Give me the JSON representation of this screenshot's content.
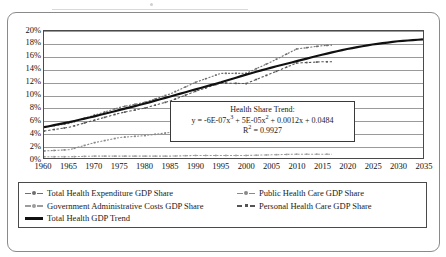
{
  "chart_data": {
    "type": "line",
    "title": "",
    "xlabel": "",
    "ylabel": "",
    "xlim": [
      1960,
      2035
    ],
    "ylim": [
      0,
      0.2
    ],
    "grid": true,
    "legend_position": "bottom",
    "x_ticks": [
      "1960",
      "1965",
      "1970",
      "1975",
      "1980",
      "1985",
      "1990",
      "1995",
      "2000",
      "2005",
      "2010",
      "2015",
      "2020",
      "2025",
      "2030",
      "2035"
    ],
    "y_ticks": [
      "0%",
      "2%",
      "4%",
      "6%",
      "8%",
      "10%",
      "12%",
      "14%",
      "16%",
      "18%",
      "20%"
    ],
    "annotation": {
      "title": "Health Share Trend:",
      "equation": "y = -6E-07x",
      "equation_exp1": "3",
      "equation_mid": " + 5E-05x",
      "equation_exp2": "2",
      "equation_tail": " + 0.0012x + 0.0484",
      "r2_label": "R",
      "r2_exp": "2",
      "r2_value": " = 0.9927"
    },
    "series": [
      {
        "name": "Total Health Expenditure GDP Share",
        "style": "marker-line",
        "color": "#6f6f6f",
        "x": [
          1960,
          1965,
          1970,
          1975,
          1980,
          1985,
          1990,
          1995,
          2000,
          2005,
          2010,
          2015,
          2017
        ],
        "values": [
          0.05,
          0.056,
          0.069,
          0.081,
          0.089,
          0.102,
          0.12,
          0.134,
          0.134,
          0.152,
          0.172,
          0.177,
          0.178
        ]
      },
      {
        "name": "Public Health Care GDP Share",
        "style": "marker-line",
        "color": "#8a8a8a",
        "x": [
          1960,
          1965,
          1970,
          1975,
          1980,
          1985,
          1990,
          1995,
          2000,
          2005,
          2010,
          2015,
          2017
        ],
        "values": [
          0.013,
          0.015,
          0.026,
          0.034,
          0.037,
          0.042,
          0.049,
          0.06,
          0.06,
          0.07,
          0.083,
          0.086,
          0.087
        ]
      },
      {
        "name": "Government Administrative Costs GDP Share",
        "style": "marker-line",
        "color": "#9c9c9c",
        "x": [
          1960,
          1965,
          1970,
          1975,
          1980,
          1985,
          1990,
          1995,
          2000,
          2005,
          2010,
          2015,
          2017
        ],
        "values": [
          0.004,
          0.004,
          0.005,
          0.005,
          0.005,
          0.005,
          0.006,
          0.006,
          0.006,
          0.007,
          0.008,
          0.008,
          0.008
        ]
      },
      {
        "name": "Personal Health Care GDP Share",
        "style": "dashed-marker",
        "color": "#555555",
        "x": [
          1960,
          1965,
          1970,
          1975,
          1980,
          1985,
          1990,
          1995,
          2000,
          2005,
          2010,
          2015,
          2017
        ],
        "values": [
          0.044,
          0.05,
          0.061,
          0.072,
          0.08,
          0.091,
          0.106,
          0.119,
          0.118,
          0.134,
          0.15,
          0.152,
          0.152
        ]
      },
      {
        "name": "Total Health GDP Trend",
        "style": "solid-thick",
        "color": "#111111",
        "x": [
          1960,
          1965,
          1970,
          1975,
          1980,
          1985,
          1990,
          1995,
          2000,
          2005,
          2010,
          2015,
          2020,
          2025,
          2030,
          2035
        ],
        "values": [
          0.05,
          0.058,
          0.067,
          0.077,
          0.087,
          0.098,
          0.109,
          0.12,
          0.132,
          0.143,
          0.153,
          0.163,
          0.172,
          0.179,
          0.184,
          0.187
        ]
      }
    ]
  }
}
